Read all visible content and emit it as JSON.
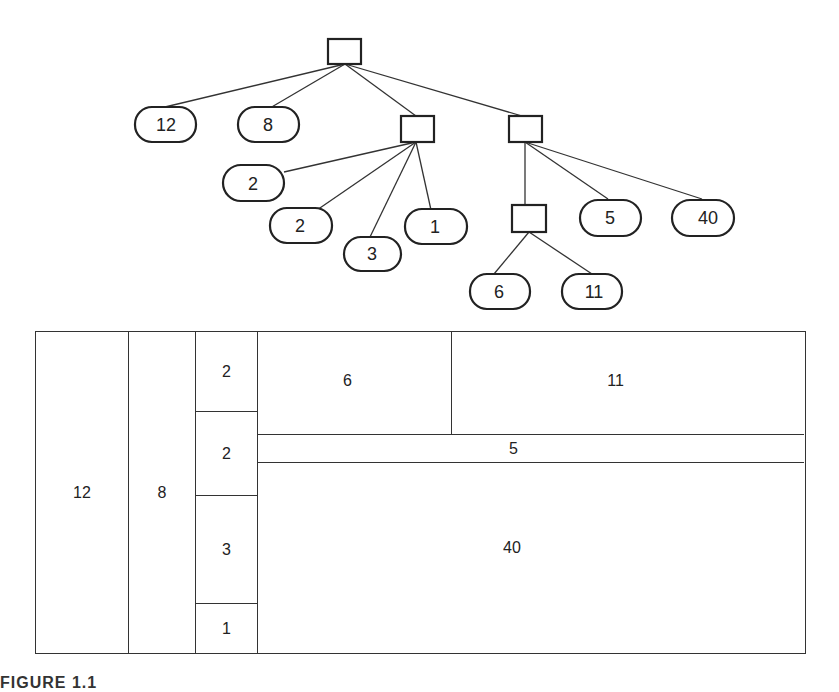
{
  "tree": {
    "root": {
      "type": "internal"
    },
    "leaves": {
      "n12": "12",
      "n8": "8",
      "n2a": "2",
      "n2b": "2",
      "n3": "3",
      "n1": "1",
      "n6": "6",
      "n11": "11",
      "n5": "5",
      "n40": "40"
    }
  },
  "treemap": {
    "cells": {
      "c12": "12",
      "c8": "8",
      "c2a": "2",
      "c2b": "2",
      "c3": "3",
      "c1": "1",
      "c6": "6",
      "c11": "11",
      "c5": "5",
      "c40": "40"
    }
  },
  "caption": "FIGURE 1.1"
}
